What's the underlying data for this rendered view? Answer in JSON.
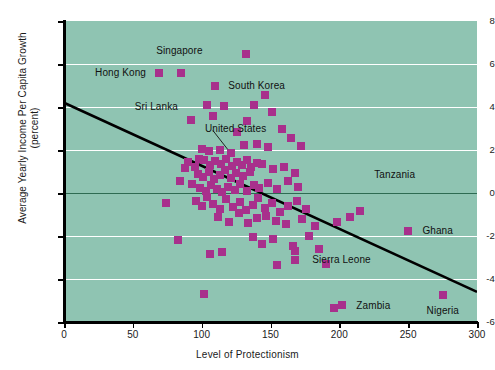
{
  "chart_data": {
    "type": "scatter",
    "title": "",
    "xlabel": "Level of Protectionism",
    "ylabel": "Average Yearly Income Per Capita Growth\n(percent)",
    "ylabel_line1": "Average Yearly Income Per Capita Growth",
    "ylabel_line2": "(percent)",
    "xlim": [
      0,
      300
    ],
    "ylim": [
      -6,
      8
    ],
    "xticks": [
      0,
      50,
      100,
      150,
      200,
      250,
      300
    ],
    "yticks": [
      -6,
      -4,
      -2,
      0,
      2,
      4,
      6,
      8
    ],
    "grid": "horizontal-white-gridlines",
    "zero_line": true,
    "legend": "none",
    "marker_color": "#a8308c",
    "plot_background": "#8fc4b2",
    "gridline_color": "#ffffff",
    "zero_line_color": "#2e6b52",
    "trendline": {
      "color": "#000000",
      "x_start": 0,
      "y_start": 4.2,
      "x_end": 300,
      "y_end": -4.6
    },
    "annotations": [
      {
        "label": "Singapore",
        "x": 85,
        "y": 5.6,
        "label_x": 84,
        "label_y": 6.6,
        "anchor": "middle"
      },
      {
        "label": "Hong Kong",
        "x": 69,
        "y": 5.6,
        "label_x": 64,
        "label_y": 5.6,
        "anchor": "end"
      },
      {
        "label": "South Korea",
        "x": 110,
        "y": 5.0,
        "label_x": 115,
        "label_y": 5.0,
        "anchor": "start"
      },
      {
        "label": "Sri Lanka",
        "x": 92,
        "y": 3.4,
        "label_x": 87,
        "label_y": 4.0,
        "anchor": "end"
      },
      {
        "label": "United States",
        "x": 121,
        "y": 1.85,
        "label_x": 98,
        "label_y": 3.0,
        "anchor": "start",
        "leader": true
      },
      {
        "label": "Tanzania",
        "x": 215,
        "y": 0.85,
        "label_x": 221,
        "label_y": 0.85,
        "anchor": "start"
      },
      {
        "label": "Ghana",
        "x": 250,
        "y": -1.75,
        "label_x": 256,
        "label_y": -1.75,
        "anchor": "start"
      },
      {
        "label": "Sierra Leone",
        "x": 168,
        "y": -2.7,
        "label_x": 176,
        "label_y": -3.1,
        "anchor": "start"
      },
      {
        "label": "Zambia",
        "x": 202,
        "y": -5.2,
        "label_x": 208,
        "label_y": -5.25,
        "anchor": "start"
      },
      {
        "label": "Nigeria",
        "x": 275,
        "y": -4.75,
        "label_x": 275,
        "label_y": -5.5,
        "anchor": "middle"
      }
    ],
    "points": [
      [
        69,
        5.6
      ],
      [
        85,
        5.6
      ],
      [
        110,
        5.0
      ],
      [
        132,
        6.45
      ],
      [
        92,
        3.4
      ],
      [
        104,
        4.1
      ],
      [
        116,
        4.05
      ],
      [
        138,
        4.1
      ],
      [
        146,
        4.55
      ],
      [
        108,
        3.6
      ],
      [
        133,
        3.35
      ],
      [
        151,
        3.75
      ],
      [
        126,
        2.85
      ],
      [
        158,
        3.0
      ],
      [
        165,
        2.55
      ],
      [
        121,
        1.85
      ],
      [
        113,
        2.0
      ],
      [
        105,
        1.95
      ],
      [
        100,
        2.05
      ],
      [
        131,
        2.25
      ],
      [
        140,
        2.3
      ],
      [
        148,
        2.15
      ],
      [
        172,
        2.2
      ],
      [
        90,
        1.45
      ],
      [
        95,
        1.2
      ],
      [
        98,
        1.6
      ],
      [
        102,
        1.55
      ],
      [
        106,
        1.3
      ],
      [
        110,
        1.5
      ],
      [
        114,
        1.35
      ],
      [
        118,
        1.6
      ],
      [
        122,
        1.25
      ],
      [
        126,
        1.45
      ],
      [
        129,
        1.3
      ],
      [
        133,
        1.55
      ],
      [
        136,
        1.2
      ],
      [
        140,
        1.4
      ],
      [
        97,
        0.9
      ],
      [
        101,
        0.75
      ],
      [
        105,
        1.0
      ],
      [
        109,
        0.65
      ],
      [
        113,
        0.85
      ],
      [
        117,
        1.05
      ],
      [
        121,
        0.7
      ],
      [
        125,
        0.95
      ],
      [
        130,
        0.8
      ],
      [
        135,
        1.0
      ],
      [
        144,
        1.35
      ],
      [
        152,
        1.1
      ],
      [
        160,
        1.2
      ],
      [
        168,
        0.95
      ],
      [
        84,
        0.55
      ],
      [
        88,
        1.15
      ],
      [
        93,
        0.4
      ],
      [
        99,
        0.25
      ],
      [
        103,
        0.1
      ],
      [
        107,
        0.35
      ],
      [
        111,
        0.2
      ],
      [
        115,
        0.05
      ],
      [
        119,
        0.3
      ],
      [
        124,
        0.15
      ],
      [
        128,
        0.4
      ],
      [
        133,
        0.1
      ],
      [
        138,
        0.35
      ],
      [
        142,
        0.25
      ],
      [
        148,
        0.45
      ],
      [
        155,
        0.2
      ],
      [
        163,
        0.55
      ],
      [
        170,
        0.3
      ],
      [
        74,
        -0.45
      ],
      [
        96,
        -0.35
      ],
      [
        100,
        -0.6
      ],
      [
        104,
        -0.2
      ],
      [
        108,
        -0.5
      ],
      [
        113,
        -0.75
      ],
      [
        118,
        -0.3
      ],
      [
        123,
        -0.65
      ],
      [
        128,
        -0.4
      ],
      [
        132,
        -0.8
      ],
      [
        137,
        -0.55
      ],
      [
        141,
        -0.25
      ],
      [
        146,
        -0.7
      ],
      [
        151,
        -0.45
      ],
      [
        157,
        -0.9
      ],
      [
        163,
        -0.6
      ],
      [
        169,
        -0.35
      ],
      [
        176,
        -0.75
      ],
      [
        112,
        -1.1
      ],
      [
        120,
        -1.35
      ],
      [
        127,
        -0.95
      ],
      [
        134,
        -1.4
      ],
      [
        140,
        -1.15
      ],
      [
        147,
        -1.05
      ],
      [
        154,
        -1.3
      ],
      [
        161,
        -1.45
      ],
      [
        173,
        -1.2
      ],
      [
        182,
        -1.55
      ],
      [
        83,
        -2.2
      ],
      [
        106,
        -2.85
      ],
      [
        115,
        -2.75
      ],
      [
        137,
        -2.05
      ],
      [
        144,
        -2.35
      ],
      [
        152,
        -2.15
      ],
      [
        166,
        -2.45
      ],
      [
        178,
        -2.0
      ],
      [
        185,
        -2.6
      ],
      [
        168,
        -2.7
      ],
      [
        168,
        -3.1
      ],
      [
        155,
        -3.35
      ],
      [
        190,
        -3.3
      ],
      [
        102,
        -4.7
      ],
      [
        196,
        -5.35
      ],
      [
        202,
        -5.2
      ],
      [
        275,
        -4.75
      ],
      [
        250,
        -1.75
      ],
      [
        215,
        -0.85
      ],
      [
        198,
        -1.35
      ],
      [
        208,
        -1.1
      ]
    ]
  }
}
